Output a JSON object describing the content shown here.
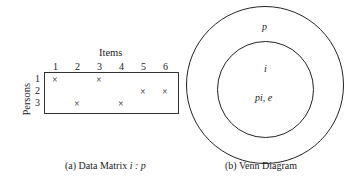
{
  "matrix": {
    "title": "Items",
    "row_axis_label": "Persons",
    "columns": [
      "1",
      "2",
      "3",
      "4",
      "5",
      "6"
    ],
    "rows": [
      "1",
      "2",
      "3"
    ],
    "mark": "×",
    "cells": [
      {
        "row": 1,
        "col": 1
      },
      {
        "row": 1,
        "col": 3
      },
      {
        "row": 2,
        "col": 5
      },
      {
        "row": 2,
        "col": 6
      },
      {
        "row": 3,
        "col": 2
      },
      {
        "row": 3,
        "col": 4
      }
    ],
    "caption": "(a) Data Matrix i : p",
    "caption_prefix": "(a) Data Matrix ",
    "caption_math": "i : p"
  },
  "venn": {
    "outer_label": "p",
    "inner_label": "i",
    "inner_sub_label": "pi, e",
    "caption": "(b) Venn Diagram"
  }
}
